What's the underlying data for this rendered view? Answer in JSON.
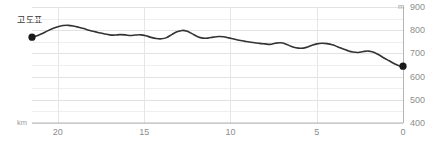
{
  "chart_data": {
    "type": "line",
    "title": "고도표",
    "xlabel": "km",
    "ylabel": "m",
    "xlim": [
      21.5,
      0
    ],
    "ylim": [
      400,
      900
    ],
    "x_reversed": true,
    "grid": true,
    "grid_major_step_y": 100,
    "grid_minor_step_y": 50,
    "legend": "none",
    "x_ticks": [
      20,
      15,
      10,
      5,
      0
    ],
    "x_tick_labels": [
      "20",
      "15",
      "10",
      "5",
      "0"
    ],
    "y_ticks": [
      900,
      800,
      700,
      600,
      500,
      400
    ],
    "y_tick_labels": [
      "900",
      "800",
      "700",
      "600",
      "500",
      "400"
    ],
    "series": [
      {
        "name": "elevation",
        "color": "#333333",
        "x": [
          21.5,
          21.2,
          20.9,
          20.6,
          20.3,
          20.0,
          19.7,
          19.4,
          19.1,
          18.8,
          18.5,
          18.2,
          17.9,
          17.6,
          17.3,
          17.0,
          16.7,
          16.4,
          16.1,
          15.8,
          15.5,
          15.2,
          14.9,
          14.6,
          14.3,
          14.0,
          13.7,
          13.4,
          13.1,
          12.8,
          12.5,
          12.2,
          11.9,
          11.6,
          11.3,
          11.0,
          10.7,
          10.4,
          10.1,
          9.8,
          9.5,
          9.2,
          8.9,
          8.6,
          8.3,
          8.0,
          7.7,
          7.4,
          7.1,
          6.8,
          6.5,
          6.2,
          5.9,
          5.6,
          5.3,
          5.0,
          4.7,
          4.4,
          4.1,
          3.8,
          3.5,
          3.2,
          2.9,
          2.6,
          2.3,
          2.0,
          1.7,
          1.4,
          1.1,
          0.8,
          0.5,
          0.2,
          0.0
        ],
        "y": [
          770,
          776,
          786,
          797,
          807,
          815,
          820,
          821,
          818,
          813,
          807,
          800,
          794,
          789,
          784,
          780,
          779,
          781,
          780,
          777,
          779,
          780,
          776,
          769,
          764,
          763,
          768,
          781,
          793,
          799,
          795,
          784,
          772,
          766,
          766,
          770,
          773,
          772,
          767,
          762,
          757,
          753,
          749,
          746,
          743,
          741,
          739,
          744,
          746,
          741,
          731,
          724,
          722,
          726,
          734,
          741,
          744,
          742,
          737,
          729,
          720,
          712,
          706,
          704,
          708,
          710,
          705,
          694,
          680,
          668,
          655,
          646,
          645
        ],
        "start_point": {
          "x": 21.5,
          "y": 770
        },
        "end_point": {
          "x": 0.0,
          "y": 645
        }
      }
    ]
  },
  "axes": {
    "y_unit": "m",
    "x_unit": "km"
  }
}
